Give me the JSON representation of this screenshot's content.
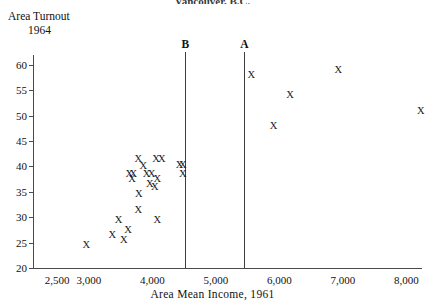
{
  "top_title": "Vancouver, B.C.",
  "ylabel_line1": "Area Turnout",
  "ylabel_line2": "1964",
  "xlabel": "Area Mean Income, 1961",
  "markers": {
    "glyph": "X"
  },
  "vertical_lines": [
    {
      "label": "A",
      "x": 5450
    },
    {
      "label": "B",
      "x": 4520
    }
  ],
  "chart_data": {
    "type": "scatter",
    "title": "Vancouver, B.C.",
    "xlabel": "Area Mean Income, 1961",
    "ylabel": "Area Turnout 1964",
    "xlim": [
      2300,
      8600
    ],
    "ylim": [
      20,
      61
    ],
    "xticks": [
      2500,
      3000,
      4000,
      5000,
      6000,
      7000,
      8000
    ],
    "xtick_labels": [
      "2,500",
      "3,000",
      "4,000",
      "5,000",
      "6,000",
      "7,000",
      "8,000"
    ],
    "yticks": [
      20,
      25,
      30,
      35,
      40,
      45,
      50,
      55,
      60
    ],
    "ytick_labels": [
      "20",
      "25",
      "30",
      "35",
      "40",
      "45",
      "50",
      "55",
      "60"
    ],
    "grid": false,
    "legend": "none",
    "marker": "X",
    "annotations": [
      {
        "text": "A",
        "x": 5450,
        "note": "vertical reference line"
      },
      {
        "text": "B",
        "x": 4520,
        "note": "vertical reference line"
      }
    ],
    "points": [
      {
        "x": 2960,
        "y": 24.5
      },
      {
        "x": 3370,
        "y": 26.5
      },
      {
        "x": 3550,
        "y": 25.5
      },
      {
        "x": 3620,
        "y": 27.5
      },
      {
        "x": 3470,
        "y": 29.5
      },
      {
        "x": 3780,
        "y": 31.5
      },
      {
        "x": 4080,
        "y": 29.5
      },
      {
        "x": 3790,
        "y": 34.5
      },
      {
        "x": 3680,
        "y": 37.5
      },
      {
        "x": 3960,
        "y": 36.5
      },
      {
        "x": 4040,
        "y": 36.0
      },
      {
        "x": 3640,
        "y": 38.5
      },
      {
        "x": 3700,
        "y": 38.5
      },
      {
        "x": 3910,
        "y": 38.5
      },
      {
        "x": 4080,
        "y": 37.5
      },
      {
        "x": 3860,
        "y": 40.0
      },
      {
        "x": 3990,
        "y": 38.6
      },
      {
        "x": 3780,
        "y": 41.5
      },
      {
        "x": 4060,
        "y": 41.5
      },
      {
        "x": 4150,
        "y": 41.5
      },
      {
        "x": 4430,
        "y": 40.2
      },
      {
        "x": 4480,
        "y": 40.2
      },
      {
        "x": 4480,
        "y": 38.5
      },
      {
        "x": 5560,
        "y": 58.0
      },
      {
        "x": 5910,
        "y": 48.0
      },
      {
        "x": 6170,
        "y": 54.0
      },
      {
        "x": 6930,
        "y": 59.0
      },
      {
        "x": 8230,
        "y": 51.0
      }
    ]
  }
}
